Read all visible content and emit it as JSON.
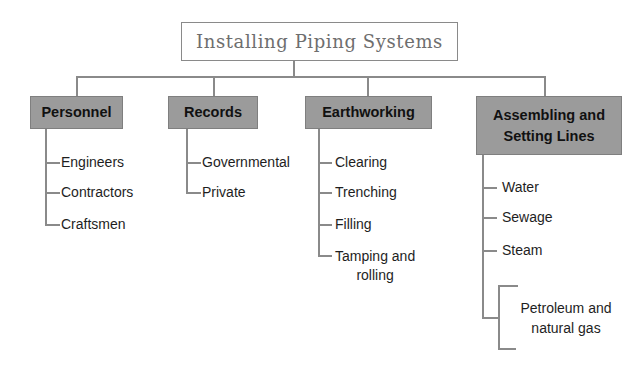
{
  "diagram": {
    "title": "Installing Piping Systems",
    "categories": [
      {
        "label": "Personnel",
        "items": [
          "Engineers",
          "Contractors",
          "Craftsmen"
        ]
      },
      {
        "label": "Records",
        "items": [
          "Governmental",
          "Private"
        ]
      },
      {
        "label": "Earthworking",
        "items": [
          "Clearing",
          "Trenching",
          "Filling",
          "Tamping and rolling"
        ]
      },
      {
        "label_line1": "Assembling and",
        "label_line2": "Setting Lines",
        "items": [
          "Water",
          "Sewage",
          "Steam",
          "Petroleum and natural gas"
        ]
      }
    ],
    "multiline": {
      "tamping_line1": "Tamping and",
      "tamping_line2": "rolling",
      "petroleum_line1": "Petroleum and",
      "petroleum_line2": "natural gas"
    },
    "colors": {
      "category_fill": "#9b9b9b",
      "connector": "#8a8a8a",
      "title_text": "#6e6e6e"
    }
  }
}
